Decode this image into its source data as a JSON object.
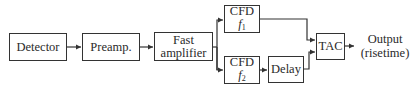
{
  "diagram": {
    "type": "block-diagram",
    "nodes": {
      "detector": {
        "label": "Detector"
      },
      "preamp": {
        "label": "Preamp."
      },
      "fast_amplifier": {
        "line1": "Fast",
        "line2": "amplifier"
      },
      "cfd1": {
        "line1": "CFD",
        "var": "f",
        "sub": "1"
      },
      "cfd2": {
        "line1": "CFD",
        "var": "f",
        "sub": "2"
      },
      "delay": {
        "label": "Delay"
      },
      "tac": {
        "label": "TAC"
      }
    },
    "output": {
      "line1": "Output",
      "line2": "(risetime)"
    },
    "edges": [
      [
        "Detector",
        "Preamp."
      ],
      [
        "Preamp.",
        "Fast amplifier"
      ],
      [
        "Fast amplifier",
        "CFD f1"
      ],
      [
        "Fast amplifier",
        "CFD f2"
      ],
      [
        "CFD f2",
        "Delay"
      ],
      [
        "CFD f1",
        "TAC"
      ],
      [
        "Delay",
        "TAC"
      ],
      [
        "TAC",
        "Output (risetime)"
      ]
    ]
  }
}
